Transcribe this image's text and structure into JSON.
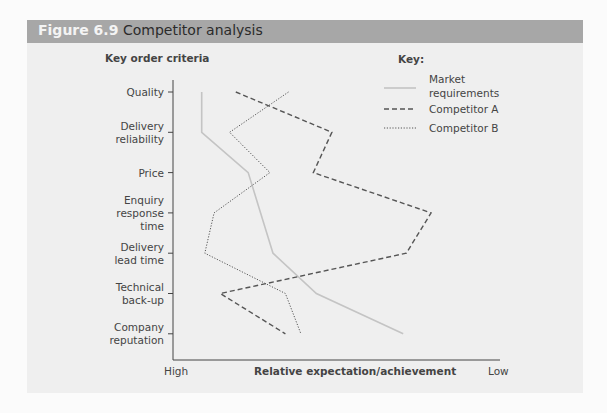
{
  "figure": {
    "number": "Figure 6.9",
    "title": "Competitor analysis"
  },
  "colors": {
    "title_bar": "#a7a7a7",
    "panel_bg": "#efefef",
    "market_line": "#c4c4c4",
    "competitor_a_line": "#555555",
    "competitor_b_line": "#555555"
  },
  "chart_data": {
    "type": "line",
    "title": "Competitor analysis",
    "orientation": "vertical-categories",
    "ylabel": "Key order criteria",
    "xlabel": "Relative expectation/achievement",
    "x_scale_labels": {
      "left": "High",
      "right": "Low"
    },
    "xlim_note": "0 = High, 100 = Low (relative position along axis)",
    "xlim": [
      0,
      100
    ],
    "categories": [
      "Quality",
      "Delivery reliability",
      "Price",
      "Enquiry response time",
      "Delivery lead time",
      "Technical back-up",
      "Company reputation"
    ],
    "category_labels": [
      [
        "Quality"
      ],
      [
        "Delivery",
        "reliability"
      ],
      [
        "Price"
      ],
      [
        "Enquiry",
        "response",
        "time"
      ],
      [
        "Delivery",
        "lead time"
      ],
      [
        "Technical",
        "back-up"
      ],
      [
        "Company",
        "reputation"
      ]
    ],
    "series": [
      {
        "name": "Market requirements",
        "style": "solid",
        "values": [
          7,
          7,
          22,
          26,
          30,
          44,
          72
        ]
      },
      {
        "name": "Competitor A",
        "style": "dashed",
        "values": [
          18,
          49,
          43,
          81,
          73,
          13,
          34
        ]
      },
      {
        "name": "Competitor B",
        "style": "dotted",
        "values": [
          35,
          16,
          29,
          11,
          8,
          34,
          39
        ]
      }
    ],
    "legend": {
      "title": "Key:",
      "position": "top-right",
      "entries": [
        [
          "Market",
          "requirements"
        ],
        [
          "Competitor A"
        ],
        [
          "Competitor B"
        ]
      ]
    },
    "grid": false
  }
}
